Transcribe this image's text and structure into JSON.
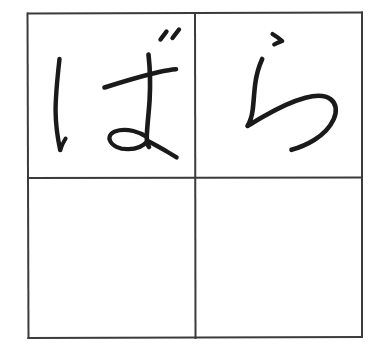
{
  "worksheet": {
    "type": "handwriting-practice-grid",
    "script": "hiragana",
    "word": "ばら",
    "romaji": "bara",
    "meaning": "rose",
    "background_color": "#ffffff",
    "ink_color": "#1a1a1a",
    "grid": {
      "rows": 2,
      "columns": 2,
      "border_color": "#3b3b3b",
      "border_width_px": 2,
      "outer_box": {
        "left": 27,
        "top": 13,
        "right": 362,
        "bottom": 338
      },
      "center_cross": {
        "x": 195,
        "y": 178
      }
    },
    "cells": [
      {
        "id": "cell-top-left",
        "row": 1,
        "column": 1,
        "character": "ば",
        "romaji": "ba",
        "filled": true,
        "stroke_count": 6
      },
      {
        "id": "cell-top-right",
        "row": 1,
        "column": 2,
        "character": "ら",
        "romaji": "ra",
        "filled": true,
        "stroke_count": 2
      },
      {
        "id": "cell-bottom-left",
        "row": 2,
        "column": 1,
        "character": "",
        "romaji": "",
        "filled": false,
        "stroke_count": 0
      },
      {
        "id": "cell-bottom-right",
        "row": 2,
        "column": 2,
        "character": "",
        "romaji": "",
        "filled": false,
        "stroke_count": 0
      }
    ]
  }
}
